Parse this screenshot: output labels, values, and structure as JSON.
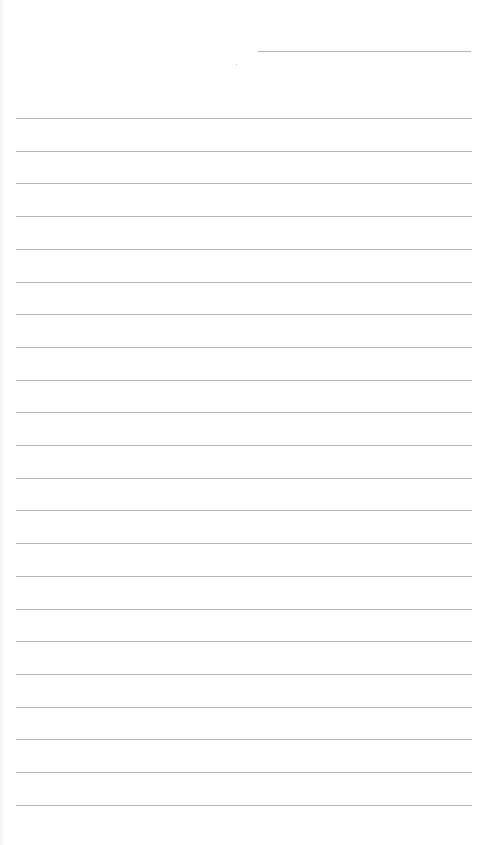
{
  "document": {
    "type": "blank ruled paper",
    "header_line": {
      "x": 258,
      "y": 51,
      "width": 213
    },
    "rules": {
      "count": 22,
      "first_y": 118,
      "spacing": 32.7,
      "x": 16,
      "width": 456,
      "color": "#b8b8b8"
    },
    "text_content": []
  }
}
